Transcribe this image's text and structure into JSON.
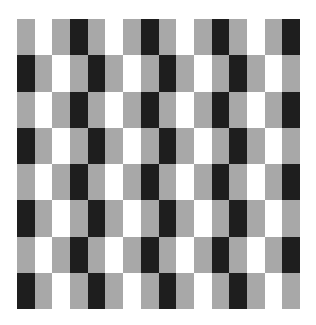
{
  "pattern": {
    "title": "",
    "columns": 16,
    "rows": 8,
    "colors": {
      "G": "#a8a8a8",
      "W": "#ffffff",
      "B": "#1e1e1e"
    },
    "grid": [
      "GWGBGWGBGWGBGWGB",
      "BGWGBGWGBGWGBGWG",
      "GWGBGWGBGWGBGWGB",
      "BGWGBGWGBGWGBGWG",
      "GWGBGWGBGWGBGWGB",
      "BGWGBGWGBGWGBGWG",
      "GWGBGWGBGWGBGWGB",
      "BGWGBGWGBGWGBGWG"
    ]
  }
}
